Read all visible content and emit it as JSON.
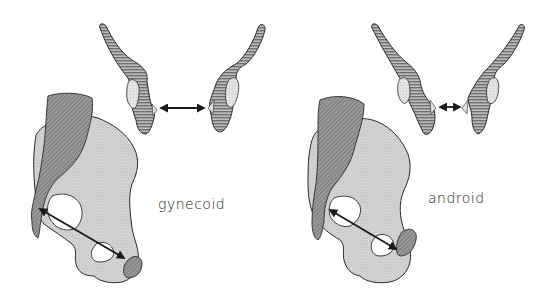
{
  "figure": {
    "panels": [
      {
        "id": "gynecoid",
        "label": "gynecoid",
        "transverse_arrow_width": "wide",
        "oblique_arrow": "long"
      },
      {
        "id": "android",
        "label": "android",
        "transverse_arrow_width": "narrow",
        "oblique_arrow": "long"
      }
    ],
    "colors": {
      "outline": "#2a2a2a",
      "hatch_fill": "#8a8a8a",
      "stipple_fill": "#cfcfcf",
      "dark_fill": "#8f8f8f",
      "background": "#ffffff"
    }
  }
}
